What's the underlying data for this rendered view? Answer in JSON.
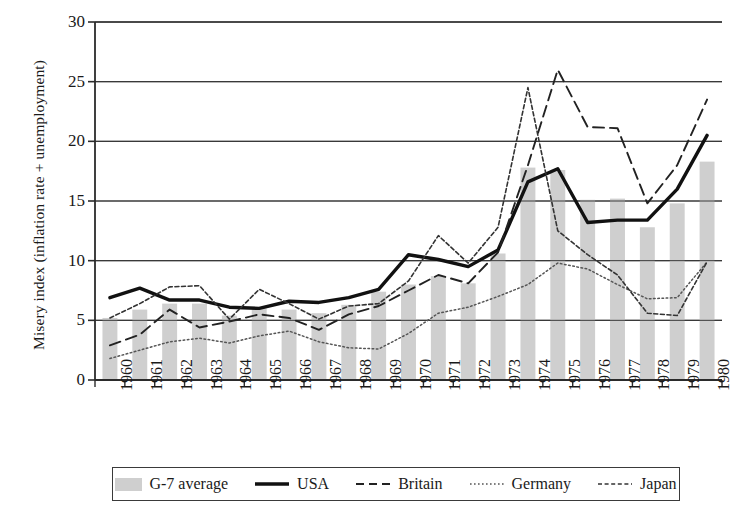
{
  "chart_data": {
    "type": "bar",
    "title": "",
    "subtitle": "",
    "xlabel": "",
    "ylabel": "Misery index (inflation rate + unemployment)",
    "categories": [
      "1960",
      "1961",
      "1962",
      "1963",
      "1964",
      "1965",
      "1966",
      "1967",
      "1968",
      "1969",
      "1970",
      "1971",
      "1972",
      "1973",
      "1974",
      "1975",
      "1976",
      "1977",
      "1978",
      "1979",
      "1980"
    ],
    "ylim": [
      0,
      30
    ],
    "yticks": [
      0,
      5,
      10,
      15,
      20,
      25,
      30
    ],
    "grid": true,
    "legend_position": "bottom",
    "bar_series": {
      "name": "G-7 average",
      "values": [
        5.2,
        5.9,
        6.4,
        6.4,
        5.4,
        6.0,
        5.9,
        5.6,
        6.3,
        7.4,
        8.0,
        8.7,
        8.1,
        10.6,
        17.8,
        17.6,
        15.1,
        15.2,
        12.8,
        14.8,
        18.3
      ]
    },
    "series": [
      {
        "name": "USA",
        "style": "solid",
        "values": [
          6.9,
          7.7,
          6.7,
          6.7,
          6.1,
          6.0,
          6.6,
          6.5,
          6.9,
          7.6,
          10.5,
          10.1,
          9.5,
          10.9,
          16.6,
          17.7,
          13.2,
          13.4,
          13.4,
          16.0,
          20.5
        ]
      },
      {
        "name": "Britain",
        "style": "dashed",
        "values": [
          2.9,
          3.8,
          5.9,
          4.4,
          4.9,
          5.5,
          5.2,
          4.2,
          5.5,
          6.2,
          7.5,
          8.8,
          8.1,
          10.7,
          18.0,
          26.0,
          21.2,
          21.1,
          14.8,
          18.0,
          23.5
        ]
      },
      {
        "name": "Germany",
        "style": "dotted",
        "values": [
          1.8,
          2.5,
          3.2,
          3.5,
          3.1,
          3.7,
          4.1,
          3.2,
          2.7,
          2.6,
          3.9,
          5.6,
          6.1,
          7.0,
          8.0,
          9.8,
          9.3,
          8.0,
          6.8,
          6.9,
          9.9
        ]
      },
      {
        "name": "Japan",
        "style": "dashdot",
        "values": [
          5.2,
          6.4,
          7.8,
          7.9,
          5.1,
          7.6,
          6.4,
          5.1,
          6.2,
          6.4,
          8.3,
          12.1,
          9.8,
          12.8,
          24.5,
          12.5,
          10.5,
          8.8,
          5.6,
          5.4,
          9.9
        ]
      }
    ],
    "annotations": []
  },
  "legend": {
    "items": [
      {
        "label": "G-7 average",
        "swatch": "bar-swatch",
        "color": "#cfcfcf"
      },
      {
        "label": "USA",
        "swatch": "solid-line",
        "color": "#111111"
      },
      {
        "label": "Britain",
        "swatch": "dashed-line",
        "color": "#222222"
      },
      {
        "label": "Germany",
        "swatch": "dotted-line",
        "color": "#555555"
      },
      {
        "label": "Japan",
        "swatch": "dashdot-line",
        "color": "#333333"
      }
    ]
  },
  "colors": {
    "bar_fill": "#cfcfcf",
    "axis": "#2b2b2b",
    "grid": "#3a3a3a",
    "usa": "#111111",
    "britain": "#222222",
    "germany": "#555555",
    "japan": "#333333"
  }
}
